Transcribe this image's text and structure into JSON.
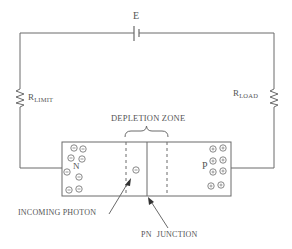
{
  "diagram": {
    "type": "photodiode circuit",
    "battery": {
      "label": "E"
    },
    "resistors": [
      {
        "id": "limit",
        "label_main": "R",
        "label_sub": "LIMIT",
        "side": "left"
      },
      {
        "id": "load",
        "label_main": "R",
        "label_sub": "LOAD",
        "side": "right"
      }
    ],
    "semiconductor": {
      "n_region_label": "N",
      "p_region_label": "P",
      "n_carriers": "−",
      "p_carriers": "+",
      "n_carrier_count": 9,
      "p_carrier_count": 8
    },
    "labels": {
      "depletion_zone": "DEPLETION ZONE",
      "incoming_photon": "INCOMING PHOTON",
      "pn_junction": "PN JUNCTION"
    },
    "colors": {
      "line": "#6a6a6a",
      "text": "#555555",
      "background": "#ffffff"
    }
  }
}
